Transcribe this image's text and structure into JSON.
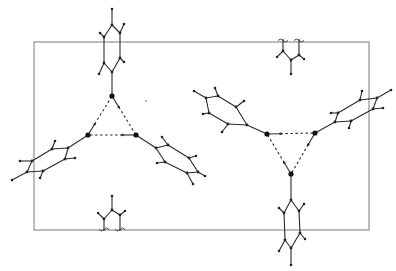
{
  "figure": {
    "colors": {
      "bond": "#2a2a2a",
      "cell": "#7a7a7a",
      "background": "#ffffff"
    },
    "labels": []
  }
}
